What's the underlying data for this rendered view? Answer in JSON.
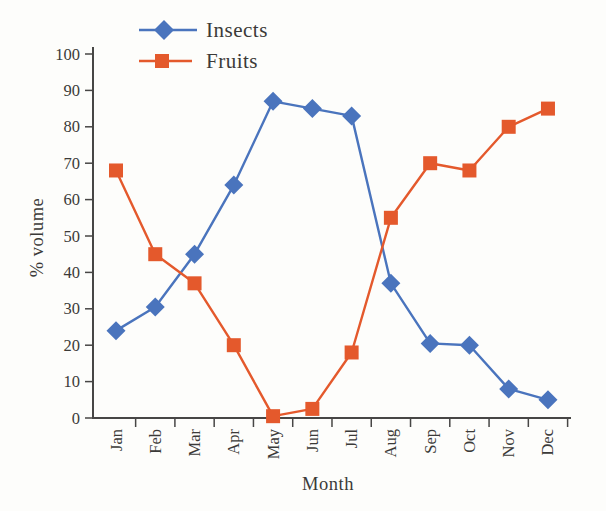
{
  "figure": {
    "background_color": "#fdfdfb",
    "text_color": "#3b3a38",
    "axis_color": "#474645"
  },
  "chart_data": {
    "type": "line",
    "title": "",
    "xlabel": "Month",
    "ylabel": "% volume",
    "categories": [
      "Jan",
      "Feb",
      "Mar",
      "Apr",
      "May",
      "Jun",
      "Jul",
      "Aug",
      "Sep",
      "Oct",
      "Nov",
      "Dec"
    ],
    "y_ticks": [
      0,
      10,
      20,
      30,
      40,
      50,
      60,
      70,
      80,
      90,
      100
    ],
    "ylim": [
      0,
      100
    ],
    "grid": false,
    "legend_position": "top-left",
    "series": [
      {
        "name": "Insects",
        "color": "#4a74bd",
        "marker": "diamond",
        "values": [
          24,
          30.5,
          45,
          64,
          87,
          85,
          83,
          37,
          20.5,
          20,
          8,
          5
        ]
      },
      {
        "name": "Fruits",
        "color": "#e4592c",
        "marker": "square",
        "values": [
          68,
          45,
          37,
          20,
          0.5,
          2.5,
          18,
          55,
          70,
          68,
          80,
          85
        ]
      }
    ]
  }
}
